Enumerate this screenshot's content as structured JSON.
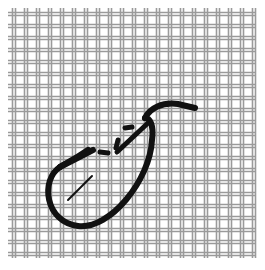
{
  "image": {
    "description": "Hand-drawn illustration of a woven wire mesh with a thick black loop stroke and dashed segment",
    "background": "#ffffff",
    "mesh_color": "#9a9a9a",
    "stroke_color": "#111111",
    "grid": {
      "x_start": 14,
      "y_start": 14,
      "spacing": 12,
      "count": 21
    }
  }
}
